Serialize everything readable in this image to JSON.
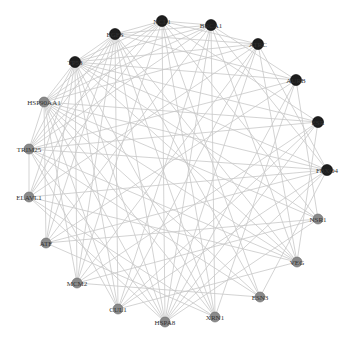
{
  "diagram": {
    "type": "network",
    "layout": "circle",
    "colors": {
      "background": "#ffffff",
      "edge": "#c8c8c8",
      "node_dark": "#1e1e1e",
      "node_light": "#8a8a8a",
      "label": "#333333"
    },
    "nodes": [
      {
        "id": "NCL1",
        "label": "NCL1",
        "x": 162,
        "y": 21,
        "shade": "dark"
      },
      {
        "id": "BRCA1",
        "label": "BRCA1",
        "x": 211,
        "y": 25,
        "shade": "dark"
      },
      {
        "id": "ATRC",
        "label": "ATRC",
        "x": 258,
        "y": 44,
        "shade": "dark"
      },
      {
        "id": "AURB",
        "label": "AURB",
        "x": 296,
        "y": 80,
        "shade": "dark"
      },
      {
        "id": "ESR",
        "label": "ESR",
        "x": 318,
        "y": 122,
        "shade": "dark"
      },
      {
        "id": "FBXO4",
        "label": "FBXO4",
        "x": 327,
        "y": 170,
        "shade": "dark"
      },
      {
        "id": "NSR1",
        "label": "NSR1",
        "x": 318,
        "y": 219,
        "shade": "light"
      },
      {
        "id": "VEG",
        "label": "VEG",
        "x": 297,
        "y": 262,
        "shade": "light"
      },
      {
        "id": "ESN3",
        "label": "ESN3",
        "x": 260,
        "y": 297,
        "shade": "light"
      },
      {
        "id": "XRN1",
        "label": "XRN1",
        "x": 215,
        "y": 317,
        "shade": "light"
      },
      {
        "id": "HSPA8",
        "label": "HSPA8",
        "x": 165,
        "y": 322,
        "shade": "light"
      },
      {
        "id": "CUL1",
        "label": "CUL1",
        "x": 118,
        "y": 309,
        "shade": "light"
      },
      {
        "id": "MCM2",
        "label": "MCM2",
        "x": 77,
        "y": 283,
        "shade": "light"
      },
      {
        "id": "ATF",
        "label": "ATF",
        "x": 46,
        "y": 243,
        "shade": "light"
      },
      {
        "id": "ELAVL1",
        "label": "ELAVL1",
        "x": 29,
        "y": 197,
        "shade": "light"
      },
      {
        "id": "TRIM25",
        "label": "TRIM25",
        "x": 29,
        "y": 149,
        "shade": "light"
      },
      {
        "id": "HSP90AA1",
        "label": "HSP90AA1",
        "x": 44,
        "y": 102,
        "shade": "light"
      },
      {
        "id": "TP53",
        "label": "TP53",
        "x": 75,
        "y": 62,
        "shade": "dark"
      },
      {
        "id": "EGFS",
        "label": "EGFS",
        "x": 115,
        "y": 34,
        "shade": "dark"
      }
    ],
    "edges": [
      [
        "NCL1",
        "ATRC"
      ],
      [
        "NCL1",
        "ESR"
      ],
      [
        "NCL1",
        "NSR1"
      ],
      [
        "NCL1",
        "ESN3"
      ],
      [
        "NCL1",
        "HSPA8"
      ],
      [
        "NCL1",
        "MCM2"
      ],
      [
        "NCL1",
        "ELAVL1"
      ],
      [
        "NCL1",
        "HSP90AA1"
      ],
      [
        "NCL1",
        "TP53"
      ],
      [
        "NCL1",
        "EGFS"
      ],
      [
        "NCL1",
        "XRN1"
      ],
      [
        "NCL1",
        "TRIM25"
      ],
      [
        "BRCA1",
        "AURB"
      ],
      [
        "BRCA1",
        "FBXO4"
      ],
      [
        "BRCA1",
        "VEG"
      ],
      [
        "BRCA1",
        "XRN1"
      ],
      [
        "BRCA1",
        "CUL1"
      ],
      [
        "BRCA1",
        "ATF"
      ],
      [
        "BRCA1",
        "TRIM25"
      ],
      [
        "BRCA1",
        "TP53"
      ],
      [
        "BRCA1",
        "EGFS"
      ],
      [
        "BRCA1",
        "HSP90AA1"
      ],
      [
        "BRCA1",
        "HSPA8"
      ],
      [
        "BRCA1",
        "NCL1"
      ],
      [
        "ATRC",
        "FBXO4"
      ],
      [
        "ATRC",
        "VEG"
      ],
      [
        "ATRC",
        "HSPA8"
      ],
      [
        "ATRC",
        "MCM2"
      ],
      [
        "ATRC",
        "ELAVL1"
      ],
      [
        "ATRC",
        "HSP90AA1"
      ],
      [
        "ATRC",
        "TP53"
      ],
      [
        "ATRC",
        "EGFS"
      ],
      [
        "ATRC",
        "CUL1"
      ],
      [
        "AURB",
        "NSR1"
      ],
      [
        "AURB",
        "XRN1"
      ],
      [
        "AURB",
        "ATF"
      ],
      [
        "AURB",
        "TRIM25"
      ],
      [
        "AURB",
        "TP53"
      ],
      [
        "AURB",
        "EGFS"
      ],
      [
        "AURB",
        "HSPA8"
      ],
      [
        "ESR",
        "VEG"
      ],
      [
        "ESR",
        "HSPA8"
      ],
      [
        "ESR",
        "MCM2"
      ],
      [
        "ESR",
        "HSP90AA1"
      ],
      [
        "ESR",
        "TP53"
      ],
      [
        "ESR",
        "CUL1"
      ],
      [
        "ESR",
        "TRIM25"
      ],
      [
        "FBXO4",
        "ESN3"
      ],
      [
        "FBXO4",
        "CUL1"
      ],
      [
        "FBXO4",
        "ELAVL1"
      ],
      [
        "FBXO4",
        "HSP90AA1"
      ],
      [
        "FBXO4",
        "TRIM25"
      ],
      [
        "FBXO4",
        "TP53"
      ],
      [
        "FBXO4",
        "ATF"
      ],
      [
        "FBXO4",
        "HSPA8"
      ],
      [
        "NSR1",
        "HSPA8"
      ],
      [
        "NSR1",
        "ATF"
      ],
      [
        "NSR1",
        "HSP90AA1"
      ],
      [
        "NSR1",
        "TP53"
      ],
      [
        "NSR1",
        "MCM2"
      ],
      [
        "VEG",
        "CUL1"
      ],
      [
        "VEG",
        "ELAVL1"
      ],
      [
        "VEG",
        "TP53"
      ],
      [
        "VEG",
        "EGFS"
      ],
      [
        "VEG",
        "HSP90AA1"
      ],
      [
        "VEG",
        "TRIM25"
      ],
      [
        "ESN3",
        "MCM2"
      ],
      [
        "ESN3",
        "TRIM25"
      ],
      [
        "ESN3",
        "EGFS"
      ],
      [
        "ESN3",
        "HSP90AA1"
      ],
      [
        "XRN1",
        "ATF"
      ],
      [
        "XRN1",
        "HSP90AA1"
      ],
      [
        "XRN1",
        "TP53"
      ],
      [
        "XRN1",
        "EGFS"
      ],
      [
        "XRN1",
        "ELAVL1"
      ],
      [
        "HSPA8",
        "ELAVL1"
      ],
      [
        "HSPA8",
        "TP53"
      ],
      [
        "HSPA8",
        "EGFS"
      ],
      [
        "HSPA8",
        "HSP90AA1"
      ],
      [
        "HSPA8",
        "TRIM25"
      ],
      [
        "CUL1",
        "TRIM25"
      ],
      [
        "CUL1",
        "TP53"
      ],
      [
        "CUL1",
        "EGFS"
      ],
      [
        "CUL1",
        "HSP90AA1"
      ],
      [
        "MCM2",
        "HSP90AA1"
      ],
      [
        "MCM2",
        "TP53"
      ],
      [
        "MCM2",
        "EGFS"
      ],
      [
        "ATF",
        "TP53"
      ],
      [
        "ATF",
        "EGFS"
      ],
      [
        "ATF",
        "HSP90AA1"
      ],
      [
        "ELAVL1",
        "TP53"
      ],
      [
        "ELAVL1",
        "EGFS"
      ],
      [
        "ELAVL1",
        "TRIM25"
      ],
      [
        "TRIM25",
        "TP53"
      ],
      [
        "TRIM25",
        "EGFS"
      ],
      [
        "TRIM25",
        "HSP90AA1"
      ],
      [
        "HSP90AA1",
        "EGFS"
      ],
      [
        "HSP90AA1",
        "TP53"
      ],
      [
        "TP53",
        "EGFS"
      ]
    ]
  }
}
